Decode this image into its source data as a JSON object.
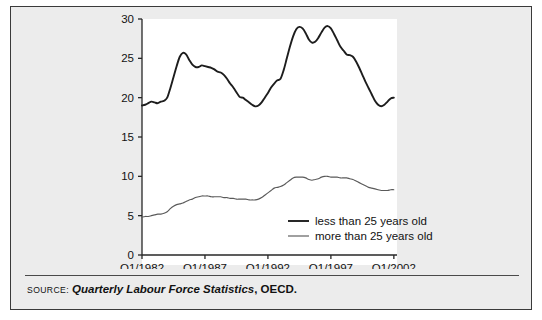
{
  "figure": {
    "source_label": "Source:",
    "source_title": "Quarterly Labour Force Statistics",
    "source_publisher": ", OECD.",
    "frame_color": "#3a3a3a",
    "background_color": "#ececec",
    "plot_background_color": "#ffffff"
  },
  "chart_data": {
    "type": "line",
    "title": "",
    "xlabel": "",
    "ylabel": "",
    "xlim": [
      1982,
      2002.25
    ],
    "ylim": [
      0,
      30
    ],
    "yticks": [
      0,
      5,
      10,
      15,
      20,
      25,
      30
    ],
    "ytick_labels": [
      "0",
      "5",
      "10",
      "15",
      "20",
      "25",
      "30"
    ],
    "xticks": [
      1982,
      1987,
      1992,
      1997,
      2002
    ],
    "xtick_labels": [
      "Q1/1982",
      "Q1/1987",
      "Q1/1992",
      "Q1/1997",
      "Q1/2002"
    ],
    "grid": false,
    "legend_position": "lower-right-inside",
    "x": [
      1982,
      1982.25,
      1982.5,
      1982.75,
      1983,
      1983.25,
      1983.5,
      1983.75,
      1984,
      1984.25,
      1984.5,
      1984.75,
      1985,
      1985.25,
      1985.5,
      1985.75,
      1986,
      1986.25,
      1986.5,
      1986.75,
      1987,
      1987.25,
      1987.5,
      1987.75,
      1988,
      1988.25,
      1988.5,
      1988.75,
      1989,
      1989.25,
      1989.5,
      1989.75,
      1990,
      1990.25,
      1990.5,
      1990.75,
      1991,
      1991.25,
      1991.5,
      1991.75,
      1992,
      1992.25,
      1992.5,
      1992.75,
      1993,
      1993.25,
      1993.5,
      1993.75,
      1994,
      1994.25,
      1994.5,
      1994.75,
      1995,
      1995.25,
      1995.5,
      1995.75,
      1996,
      1996.25,
      1996.5,
      1996.75,
      1997,
      1997.25,
      1997.5,
      1997.75,
      1998,
      1998.25,
      1998.5,
      1998.75,
      1999,
      1999.25,
      1999.5,
      1999.75,
      2000,
      2000.25,
      2000.5,
      2000.75,
      2001,
      2001.25,
      2001.5,
      2001.75,
      2002
    ],
    "series": [
      {
        "name": "less than 25 years old",
        "color": "#1d1d1d",
        "linewidth": 1.9,
        "values": [
          19.0,
          19.1,
          19.3,
          19.5,
          19.4,
          19.3,
          19.5,
          19.6,
          20.0,
          21.2,
          22.6,
          24.0,
          25.2,
          25.7,
          25.5,
          24.8,
          24.2,
          23.9,
          23.9,
          24.1,
          24.0,
          23.9,
          23.8,
          23.6,
          23.3,
          23.2,
          22.9,
          22.4,
          21.8,
          21.3,
          20.7,
          20.1,
          20.0,
          19.7,
          19.4,
          19.1,
          18.9,
          19.0,
          19.4,
          20.0,
          20.6,
          21.3,
          21.8,
          22.2,
          22.4,
          23.5,
          25.0,
          26.5,
          27.8,
          28.7,
          29.0,
          28.8,
          28.2,
          27.4,
          27.0,
          27.1,
          27.6,
          28.3,
          28.9,
          29.1,
          28.8,
          28.1,
          27.3,
          26.5,
          26.0,
          25.5,
          25.4,
          25.2,
          24.6,
          23.8,
          22.9,
          22.0,
          21.2,
          20.4,
          19.6,
          19.1,
          18.9,
          19.1,
          19.5,
          19.9,
          20.0
        ]
      },
      {
        "name": "more than 25 years old",
        "color": "#5a5a5a",
        "linewidth": 1.15,
        "values": [
          4.8,
          4.9,
          4.9,
          5.0,
          5.1,
          5.2,
          5.2,
          5.3,
          5.5,
          5.9,
          6.2,
          6.4,
          6.5,
          6.6,
          6.8,
          7.0,
          7.1,
          7.3,
          7.4,
          7.5,
          7.5,
          7.5,
          7.4,
          7.4,
          7.4,
          7.4,
          7.3,
          7.3,
          7.2,
          7.2,
          7.1,
          7.1,
          7.1,
          7.1,
          7.0,
          7.0,
          7.0,
          7.1,
          7.3,
          7.6,
          7.9,
          8.2,
          8.5,
          8.6,
          8.7,
          8.9,
          9.2,
          9.5,
          9.8,
          9.9,
          9.9,
          9.9,
          9.8,
          9.6,
          9.5,
          9.6,
          9.7,
          9.9,
          10.0,
          10.0,
          9.9,
          9.9,
          9.9,
          9.8,
          9.8,
          9.8,
          9.7,
          9.6,
          9.4,
          9.2,
          9.0,
          8.8,
          8.6,
          8.5,
          8.4,
          8.3,
          8.2,
          8.2,
          8.2,
          8.3,
          8.3
        ]
      }
    ],
    "legend": [
      {
        "label": "less than 25 years old"
      },
      {
        "label": "more than 25 years old"
      }
    ]
  }
}
